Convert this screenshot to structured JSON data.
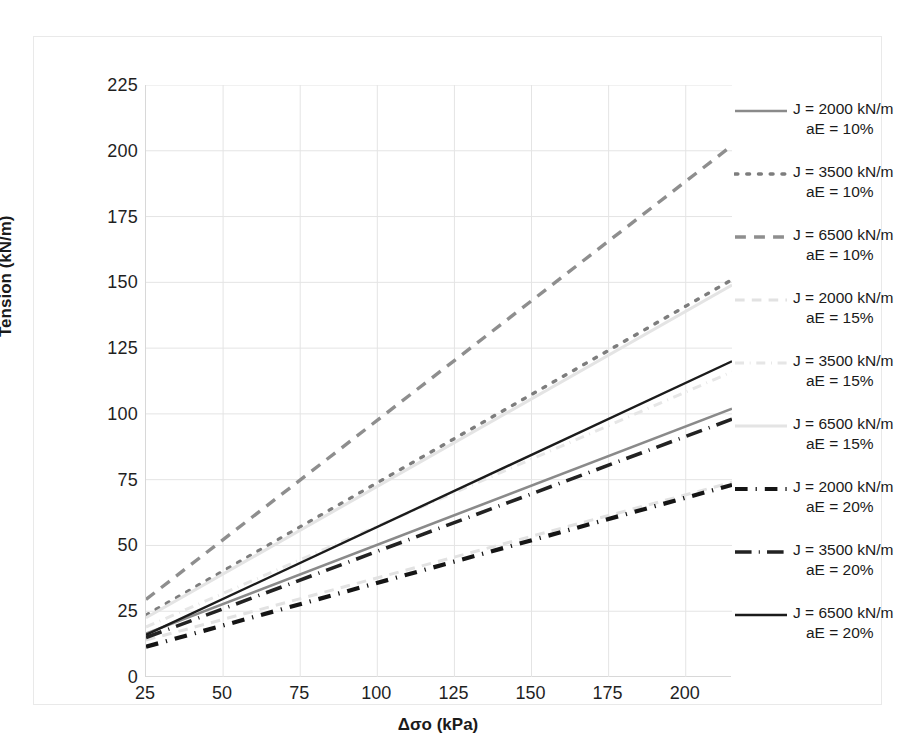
{
  "chart_data": {
    "type": "line",
    "title": "",
    "xlabel": "Δσo (kPa)",
    "ylabel": "Tension (kN/m)",
    "xlim": [
      25,
      215
    ],
    "ylim": [
      0,
      225
    ],
    "xticks": [
      25,
      50,
      75,
      100,
      125,
      150,
      175,
      200
    ],
    "yticks": [
      0,
      25,
      50,
      75,
      100,
      125,
      150,
      175,
      200,
      225
    ],
    "grid": true,
    "legend_position": "right",
    "x": [
      25,
      215
    ],
    "series": [
      {
        "name": "J = 2000 kN/m aE = 10%",
        "label_line1": "J = 2000 kN/m",
        "label_line2": "aE = 10%",
        "J": 2000,
        "aE": "10%",
        "style": "solid",
        "color": "#8a8a8a",
        "width": 2.6,
        "values": [
          16.5,
          102
        ]
      },
      {
        "name": "J = 3500 kN/m aE = 10%",
        "label_line1": "J = 3500 kN/m",
        "label_line2": "aE = 10%",
        "J": 3500,
        "aE": "10%",
        "style": "dotted",
        "color": "#7d7d7d",
        "width": 3.4,
        "values": [
          23.5,
          151
        ]
      },
      {
        "name": "J = 6500 kN/m aE = 10%",
        "label_line1": "J = 6500 kN/m",
        "label_line2": "aE = 10%",
        "J": 6500,
        "aE": "10%",
        "style": "dashed",
        "color": "#8e8e8e",
        "width": 3.4,
        "values": [
          29.5,
          202
        ]
      },
      {
        "name": "J = 2000 kN/m aE = 15%",
        "label_line1": "J = 2000 kN/m",
        "label_line2": "aE = 15%",
        "J": 2000,
        "aE": "15%",
        "style": "dashed",
        "color": "#e2e2e2",
        "width": 3.0,
        "values": [
          14.0,
          74
        ]
      },
      {
        "name": "J = 3500 kN/m aE = 15%",
        "label_line1": "J = 3500 kN/m",
        "label_line2": "aE = 15%",
        "J": 3500,
        "aE": "15%",
        "style": "dashdot",
        "color": "#e6e6e6",
        "width": 3.0,
        "values": [
          19.0,
          116
        ]
      },
      {
        "name": "J = 6500 kN/m aE = 15%",
        "label_line1": "J = 6500 kN/m",
        "label_line2": "aE = 15%",
        "J": 6500,
        "aE": "15%",
        "style": "solid",
        "color": "#e4e4e4",
        "width": 3.0,
        "values": [
          22.5,
          149
        ]
      },
      {
        "name": "J = 2000 kN/m aE = 20%",
        "label_line1": "J = 2000 kN/m",
        "label_line2": "aE = 20%",
        "J": 2000,
        "aE": "20%",
        "style": "dashdot",
        "color": "#151515",
        "width": 4.2,
        "values": [
          11.5,
          73
        ]
      },
      {
        "name": "J = 3500 kN/m aE = 20%",
        "label_line1": "J = 3500 kN/m",
        "label_line2": "aE = 20%",
        "J": 3500,
        "aE": "20%",
        "style": "longdashdot",
        "color": "#222222",
        "width": 3.6,
        "values": [
          15.0,
          98
        ]
      },
      {
        "name": "J = 6500 kN/m aE = 20%",
        "label_line1": "J = 6500 kN/m",
        "label_line2": "aE = 20%",
        "J": 6500,
        "aE": "20%",
        "style": "solid",
        "color": "#1b1b1b",
        "width": 2.4,
        "values": [
          16.0,
          120
        ]
      }
    ]
  },
  "axes": {
    "y_title": "Tension (kN/m)",
    "x_title": "Δσo (kPa)"
  }
}
